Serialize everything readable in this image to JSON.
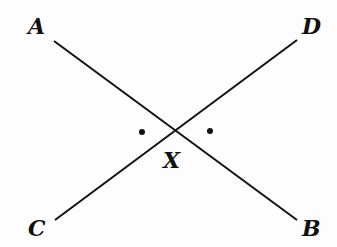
{
  "diagram": {
    "points": [
      {
        "name": "A",
        "x": 40,
        "y": 34
      },
      {
        "name": "D",
        "x": 314,
        "y": 34
      },
      {
        "name": "X",
        "x": 176,
        "y": 168
      },
      {
        "name": "C",
        "x": 40,
        "y": 236
      },
      {
        "name": "B",
        "x": 314,
        "y": 236
      }
    ],
    "lines": [
      {
        "name": "AB",
        "from": [
          54,
          41
        ],
        "to": [
          297,
          220
        ]
      },
      {
        "name": "CD",
        "from": [
          55,
          220
        ],
        "to": [
          297,
          40
        ]
      }
    ],
    "angle_marks": [
      {
        "x": 142,
        "y": 132
      },
      {
        "x": 210,
        "y": 131
      }
    ],
    "colors": {
      "line": "#111111",
      "background": "#fdfdfd"
    }
  }
}
